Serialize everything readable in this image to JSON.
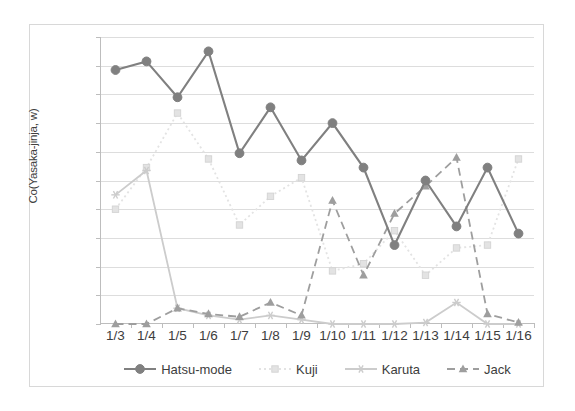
{
  "chart_data": {
    "type": "line",
    "title": "",
    "subtitle": "",
    "xlabel": "",
    "ylabel": "Co(Yasaka-jinja, w)",
    "categories": [
      "1/3",
      "1/4",
      "1/5",
      "1/6",
      "1/7",
      "1/8",
      "1/9",
      "1/10",
      "1/11",
      "1/12",
      "1/13",
      "1/14",
      "1/15",
      "1/16"
    ],
    "ylim": [
      0.0,
      0.2
    ],
    "ytick_labels": [
      "0.00",
      "0.02",
      "0.04",
      "0.06",
      "0.08",
      "0.10",
      "0.12",
      "0.14",
      "0.16",
      "0.18",
      "0.20"
    ],
    "ytick_values": [
      0.0,
      0.02,
      0.04,
      0.06,
      0.08,
      0.1,
      0.12,
      0.14,
      0.16,
      0.18,
      0.2
    ],
    "grid": true,
    "legend_position": "bottom",
    "series": [
      {
        "name": "Hatsu-mode",
        "color": "#808080",
        "marker": "circle",
        "dash": "solid",
        "values": [
          0.177,
          0.183,
          0.158,
          0.19,
          0.119,
          0.151,
          0.114,
          0.14,
          0.109,
          0.055,
          0.1,
          0.068,
          0.109,
          0.063
        ]
      },
      {
        "name": "Kuji",
        "color": "#e3e3e3",
        "marker": "square",
        "dash": "dotted",
        "values": [
          0.08,
          0.109,
          0.147,
          0.115,
          0.069,
          0.089,
          0.102,
          0.037,
          0.042,
          0.065,
          0.034,
          0.053,
          0.055,
          0.115
        ]
      },
      {
        "name": "Karuta",
        "color": "#cccccc",
        "marker": "star",
        "dash": "solid",
        "values": [
          0.09,
          0.107,
          0.011,
          0.006,
          0.003,
          0.006,
          0.003,
          0.0,
          0.0,
          0.0,
          0.001,
          0.015,
          0.0,
          0.0
        ]
      },
      {
        "name": "Jack",
        "color": "#9e9e9e",
        "marker": "triangle",
        "dash": "dashed",
        "values": [
          0.0,
          0.0,
          0.011,
          0.007,
          0.005,
          0.015,
          0.006,
          0.086,
          0.034,
          0.077,
          0.096,
          0.116,
          0.007,
          0.001
        ]
      }
    ]
  },
  "figure": {
    "background_color": "#ffffff",
    "frame_color": "#d8d8d8",
    "grid_color": "#dddddd",
    "axis_color": "#bdbdbd",
    "text_color": "#3d3d3d"
  }
}
